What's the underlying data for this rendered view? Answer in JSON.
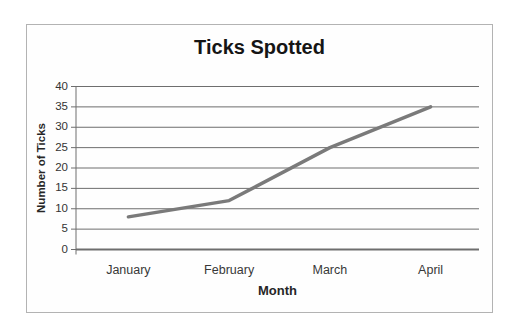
{
  "chart_data": {
    "type": "line",
    "title": "Ticks Spotted",
    "xlabel": "Month",
    "ylabel": "Number of Ticks",
    "categories": [
      "January",
      "February",
      "March",
      "April"
    ],
    "series": [
      {
        "values": [
          8,
          12,
          25,
          35
        ]
      }
    ],
    "ylim": [
      0,
      40
    ],
    "ytick_step": 5,
    "ytick_labels": [
      "0",
      "5",
      "10",
      "15",
      "20",
      "25",
      "30",
      "35",
      "40"
    ],
    "grid": "horizontal-on",
    "legend": "none",
    "colors": {
      "line": "#7a7a7a",
      "grid": "#6e6e6e",
      "axis": "#6e6e6e",
      "tick_text": "#333333",
      "title_text": "#151515",
      "frame_border": "#b3b3b3",
      "background": "#ffffff"
    }
  }
}
